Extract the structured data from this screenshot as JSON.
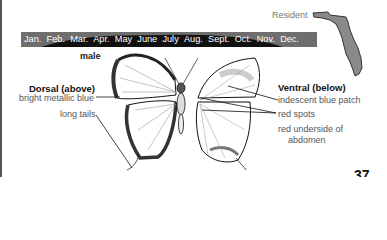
{
  "range": {
    "status_label": "Resident",
    "map_icon": "florida-map-icon"
  },
  "flight_bar": {
    "months": [
      "Jan.",
      "Feb.",
      "Mar.",
      "Apr.",
      "May",
      "June",
      "July",
      "Aug.",
      "Sept.",
      "Oct.",
      "Nov.",
      "Dec."
    ],
    "bar_color": "#6e6e6e",
    "season_color": "#111111"
  },
  "figure": {
    "sex_label": "male",
    "dorsal": {
      "title": "Dorsal (above)",
      "labels": [
        "bright metallic blue",
        "long tails"
      ]
    },
    "ventral": {
      "title": "Ventral (below)",
      "labels": [
        "indescent blue patch",
        "red spots",
        "red underside of",
        "abdomen"
      ]
    }
  },
  "page_number": "37"
}
